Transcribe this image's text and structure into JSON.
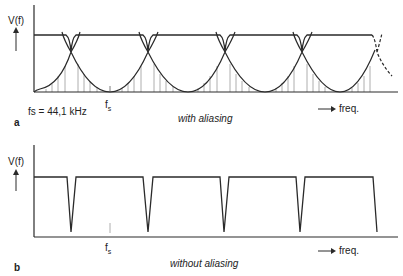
{
  "panel_a": {
    "letter": "a",
    "y_label": "V(f)",
    "tick_label": "f",
    "tick_sub": "s",
    "sample_rate_note": "fs = 44,1 kHz",
    "caption": "with aliasing",
    "x_label": "freq."
  },
  "panel_b": {
    "letter": "b",
    "y_label": "V(f)",
    "tick_label": "f",
    "tick_sub": "s",
    "caption": "without aliasing",
    "x_label": "freq."
  },
  "colors": {
    "line": "#2a2a2a",
    "hatch": "#9a9a9a",
    "background": "#ffffff"
  }
}
